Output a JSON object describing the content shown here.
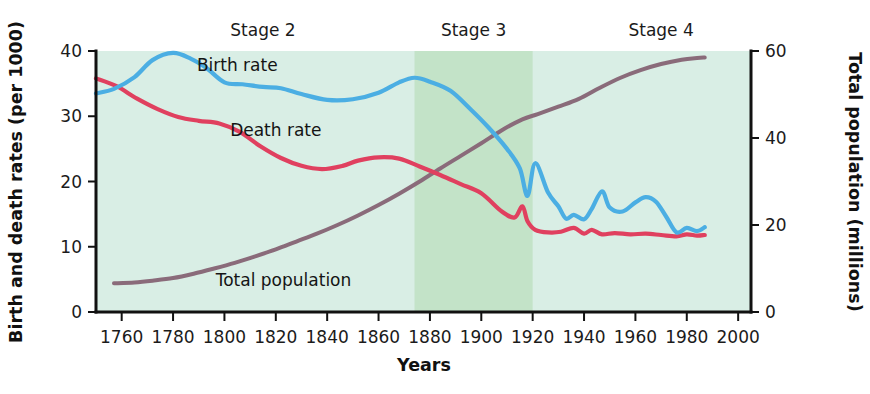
{
  "chart_data": {
    "type": "line",
    "title": "",
    "xlabel": "Years",
    "ylabel_left": "Birth and death rates (per 1000)",
    "ylabel_right": "Total population (millions)",
    "xlim": [
      1750,
      2005
    ],
    "ylim_left": [
      0,
      40
    ],
    "ylim_right": [
      0,
      60
    ],
    "grid": false,
    "legend_position": "inline-annotations",
    "background_color": "#d9eee5",
    "shaded_band_color": "#c3e3c8",
    "x_ticks": [
      1760,
      1780,
      1800,
      1820,
      1840,
      1860,
      1880,
      1900,
      1920,
      1940,
      1960,
      1980,
      2000
    ],
    "y_ticks_left": [
      0,
      10,
      20,
      30,
      40
    ],
    "y_ticks_right": [
      0,
      20,
      40,
      60
    ],
    "annotations": [
      {
        "text": "Stage 2",
        "x": 1815,
        "role": "stage-label"
      },
      {
        "text": "Stage 3",
        "x": 1897,
        "role": "stage-label"
      },
      {
        "text": "Stage 4",
        "x": 1970,
        "role": "stage-label"
      }
    ],
    "shaded_regions": [
      {
        "name": "Stage 3",
        "x_start": 1874,
        "x_end": 1920,
        "color": "#c3e3c8"
      }
    ],
    "series": [
      {
        "name": "Birth rate",
        "color": "#4BAEE3",
        "axis": "left",
        "unit": "per 1000",
        "label_x": 1805,
        "label_y": 37,
        "x": [
          1750,
          1757,
          1765,
          1772,
          1780,
          1787,
          1793,
          1800,
          1807,
          1815,
          1822,
          1830,
          1840,
          1850,
          1860,
          1868,
          1874,
          1880,
          1888,
          1896,
          1903,
          1910,
          1915,
          1918,
          1921,
          1926,
          1930,
          1933,
          1936,
          1940,
          1943,
          1947,
          1950,
          1955,
          1960,
          1964,
          1968,
          1972,
          1976,
          1980,
          1984,
          1987
        ],
        "y": [
          33.5,
          34.2,
          36.0,
          38.6,
          39.7,
          38.8,
          37.4,
          35.2,
          34.9,
          34.5,
          34.3,
          33.4,
          32.5,
          32.6,
          33.6,
          35.2,
          35.9,
          35.3,
          33.9,
          31.0,
          28.2,
          25.0,
          22.0,
          17.8,
          22.8,
          18.3,
          16.2,
          14.3,
          14.9,
          14.2,
          15.8,
          18.5,
          16.0,
          15.4,
          16.8,
          17.6,
          16.9,
          14.6,
          12.2,
          12.9,
          12.4,
          13.0
        ]
      },
      {
        "name": "Death rate",
        "color": "#E0405F",
        "axis": "left",
        "unit": "per 1000",
        "label_x": 1820,
        "label_y": 27,
        "x": [
          1750,
          1758,
          1766,
          1774,
          1782,
          1790,
          1798,
          1806,
          1814,
          1822,
          1830,
          1838,
          1846,
          1852,
          1860,
          1868,
          1876,
          1884,
          1892,
          1900,
          1908,
          1913,
          1916,
          1918,
          1921,
          1926,
          1931,
          1936,
          1940,
          1943,
          1947,
          1952,
          1958,
          1964,
          1970,
          1976,
          1980,
          1984,
          1987
        ],
        "y": [
          35.8,
          34.6,
          32.7,
          31.1,
          29.9,
          29.3,
          28.9,
          27.6,
          25.4,
          23.6,
          22.4,
          21.9,
          22.4,
          23.2,
          23.7,
          23.5,
          22.3,
          21.0,
          19.6,
          18.2,
          15.4,
          14.5,
          16.2,
          13.9,
          12.6,
          12.2,
          12.3,
          12.9,
          12.0,
          12.6,
          11.9,
          12.1,
          11.9,
          12.0,
          11.8,
          11.6,
          11.9,
          11.7,
          11.8
        ]
      },
      {
        "name": "Total population",
        "color": "#8A6B7A",
        "axis": "right",
        "unit": "millions",
        "label_x": 1823,
        "label_y": 6,
        "x": [
          1757,
          1765,
          1772,
          1780,
          1788,
          1796,
          1804,
          1812,
          1820,
          1828,
          1836,
          1844,
          1852,
          1860,
          1868,
          1876,
          1884,
          1892,
          1900,
          1908,
          1916,
          1922,
          1930,
          1938,
          1946,
          1954,
          1962,
          1970,
          1978,
          1984,
          1987
        ],
        "y": [
          6.6,
          6.8,
          7.2,
          7.8,
          8.8,
          10.0,
          11.3,
          12.8,
          14.4,
          16.2,
          18.0,
          20.0,
          22.2,
          24.6,
          27.2,
          30.0,
          33.0,
          35.9,
          38.8,
          41.8,
          44.3,
          45.5,
          47.2,
          49.0,
          51.5,
          53.8,
          55.6,
          57.0,
          58.0,
          58.4,
          58.5
        ]
      }
    ]
  }
}
